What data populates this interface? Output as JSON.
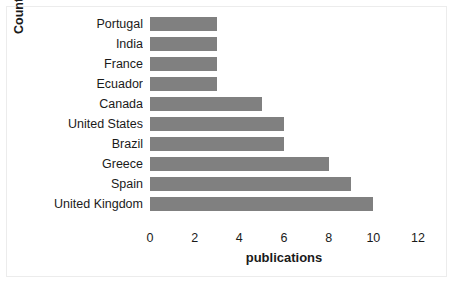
{
  "chart_data": {
    "type": "bar",
    "orientation": "horizontal",
    "title": "",
    "xlabel": "publications",
    "ylabel": "Country",
    "categories": [
      "Portugal",
      "India",
      "France",
      "Ecuador",
      "Canada",
      "United States",
      "Brazil",
      "Greece",
      "Spain",
      "United Kingdom"
    ],
    "values": [
      3,
      3,
      3,
      3,
      5,
      6,
      6,
      8,
      9,
      10
    ],
    "xlim": [
      0,
      12
    ],
    "xticks": [
      0,
      2,
      4,
      6,
      8,
      10,
      12
    ],
    "xtick_labels": [
      "0",
      "2",
      "4",
      "6",
      "8",
      "10",
      "12"
    ],
    "grid": false,
    "legend": false,
    "bar_color": "#808080",
    "background_color": "#ffffff",
    "frame_color": "#ececec",
    "text_color": "#1a1a1a"
  }
}
